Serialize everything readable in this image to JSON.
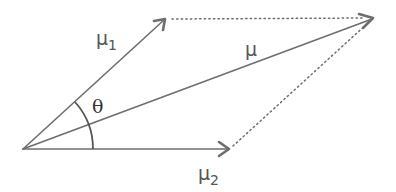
{
  "diagram": {
    "vectors": [
      {
        "id": "mu1",
        "label": "μ",
        "subscript": "1",
        "from": [
          23,
          149
        ],
        "to": [
          165,
          19
        ]
      },
      {
        "id": "mu",
        "label": "μ",
        "subscript": "",
        "from": [
          23,
          149
        ],
        "to": [
          373,
          18
        ]
      },
      {
        "id": "mu2",
        "label": "μ",
        "subscript": "2",
        "from": [
          23,
          149
        ],
        "to": [
          229,
          149
        ]
      }
    ],
    "dotted_lines": [
      {
        "from": [
          165,
          19
        ],
        "to": [
          373,
          18
        ]
      },
      {
        "from": [
          229,
          149
        ],
        "to": [
          373,
          18
        ]
      }
    ],
    "angle": {
      "label": "θ",
      "between": [
        "mu1",
        "mu2"
      ]
    },
    "labels": {
      "mu1_main": "μ",
      "mu1_sub": "1",
      "mu_main": "μ",
      "mu2_main": "μ",
      "mu2_sub": "2",
      "theta": "θ"
    },
    "colors": {
      "line": "#6e6e6e",
      "text": "#555555",
      "background": "#ffffff"
    }
  }
}
